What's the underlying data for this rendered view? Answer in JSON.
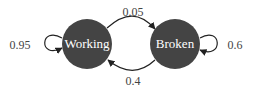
{
  "diagram": {
    "type": "markov-chain",
    "colors": {
      "node_fill": "#444444",
      "node_text": "#ffffff",
      "edge": "#222222",
      "label": "#444444"
    },
    "nodes": [
      {
        "id": "working",
        "label": "Working"
      },
      {
        "id": "broken",
        "label": "Broken"
      }
    ],
    "edges": [
      {
        "from": "working",
        "to": "working",
        "label": "0.95"
      },
      {
        "from": "working",
        "to": "broken",
        "label": "0.05"
      },
      {
        "from": "broken",
        "to": "working",
        "label": "0.4"
      },
      {
        "from": "broken",
        "to": "broken",
        "label": "0.6"
      }
    ]
  }
}
